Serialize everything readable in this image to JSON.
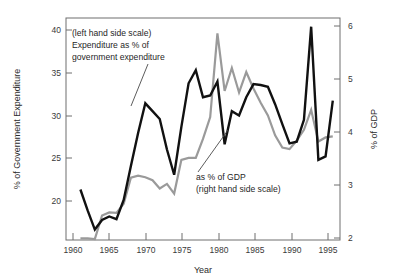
{
  "chart_data": {
    "type": "line",
    "title": "",
    "xlabel": "Year",
    "ylabel_left": "% of Government Expenditure",
    "ylabel_right": "% of GDP",
    "xlim": [
      1959.0,
      1997.0
    ],
    "ylim_left": [
      16.0,
      41.5
    ],
    "ylim_right": [
      1.85,
      6.2
    ],
    "xticks": [
      1960,
      1965,
      1970,
      1975,
      1980,
      1985,
      1990,
      1995
    ],
    "xticklabels": [
      "1960",
      "1965",
      "1970",
      "1975",
      "1980",
      "1985",
      "1990",
      "1995"
    ],
    "yticks_left": [
      20,
      25,
      30,
      35,
      40
    ],
    "yticklabels_left": [
      "20",
      "25",
      "30",
      "35",
      "40"
    ],
    "yticks_right": [
      2,
      3,
      4,
      5,
      6
    ],
    "yticklabels_right": [
      "2",
      "3",
      "4",
      "5",
      "6"
    ],
    "grid": false,
    "legend_position": "inline-annotations",
    "series": [
      {
        "name": "Expenditure as % of government expenditure",
        "axis": "left",
        "color": "#111111",
        "x": [
          1961,
          1962,
          1963,
          1964,
          1965,
          1966,
          1967,
          1968,
          1969,
          1970,
          1971,
          1972,
          1973,
          1974,
          1975,
          1976,
          1977,
          1978,
          1979,
          1980,
          1981,
          1982,
          1983,
          1984,
          1985,
          1986,
          1987,
          1988,
          1989,
          1990,
          1991,
          1992,
          1993,
          1994,
          1995,
          1996
        ],
        "values": [
          21.8,
          19.4,
          17.2,
          18.3,
          18.7,
          18.4,
          20.6,
          24.5,
          28.3,
          31.7,
          30.8,
          29.9,
          26.4,
          23.5,
          29.0,
          34.0,
          35.5,
          32.4,
          32.6,
          34.2,
          27.0,
          30.8,
          30.3,
          32.4,
          33.9,
          33.8,
          33.6,
          31.6,
          29.3,
          27.1,
          27.3,
          29.8,
          40.5,
          25.2,
          25.6,
          32.0
        ]
      },
      {
        "name": "as % of GDP",
        "axis": "right",
        "color": "#9a9a9a",
        "x": [
          1961,
          1962,
          1963,
          1964,
          1965,
          1966,
          1967,
          1968,
          1969,
          1970,
          1971,
          1972,
          1973,
          1974,
          1975,
          1976,
          1977,
          1978,
          1979,
          1980,
          1981,
          1982,
          1983,
          1984,
          1985,
          1986,
          1987,
          1988,
          1989,
          1990,
          1991,
          1992,
          1993,
          1994,
          1995,
          1996
        ],
        "values": [
          1.88,
          1.88,
          1.87,
          2.33,
          2.39,
          2.38,
          2.56,
          3.07,
          3.11,
          3.08,
          3.02,
          2.86,
          2.95,
          2.76,
          3.42,
          3.46,
          3.46,
          3.83,
          4.26,
          5.9,
          4.77,
          5.22,
          4.74,
          5.14,
          4.82,
          4.54,
          4.29,
          3.9,
          3.66,
          3.63,
          3.8,
          4.01,
          4.4,
          3.78,
          3.86,
          3.88
        ]
      }
    ],
    "annotations": [
      {
        "name": "left-scale-annotation",
        "lines": [
          "(left hand side scale)",
          "Expenditure as % of",
          "government expenditure"
        ],
        "leader_to_series": "Expenditure as % of government expenditure"
      },
      {
        "name": "right-scale-annotation",
        "lines": [
          "as % of GDP",
          "(right hand side scale)"
        ],
        "leader_to_series": "as % of GDP"
      }
    ]
  },
  "colors": {
    "black_series": "#111111",
    "grey_series": "#9a9a9a",
    "frame": "#6e6e6e",
    "text": "#1f1f1f",
    "background": "#ffffff"
  }
}
